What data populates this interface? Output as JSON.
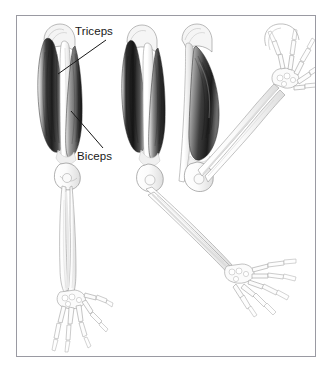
{
  "figure": {
    "border_color": "#9a9aa2",
    "background_color": "#ffffff",
    "ink_color": "#181818",
    "labels": [
      {
        "id": "triceps",
        "text": "Triceps",
        "leader_from": [
          106,
          40
        ],
        "leader_to": [
          58,
          74
        ]
      },
      {
        "id": "biceps",
        "text": "Biceps",
        "leader_from": [
          71,
          111
        ],
        "leader_to": [
          103,
          148
        ]
      }
    ],
    "views": [
      {
        "id": "view-extended-front",
        "description": "Left view: arm fully extended downward, triceps shaded dark on the outer side, biceps on inner side, with forearm bones and open skeletal hand at bottom."
      },
      {
        "id": "view-extended-oblique",
        "description": "Middle-left view: upper arm with muscles, elbow bent slightly, forearm extending diagonally down and to the right ending in a skeletal hand."
      },
      {
        "id": "view-flexed",
        "description": "Right view: upper arm with contracted biceps, elbow strongly flexed, forearm angled upward to the right, skeletal hand raised at top right."
      }
    ],
    "muscles": [
      {
        "name": "Triceps",
        "shading": "dark",
        "side": "posterior"
      },
      {
        "name": "Biceps",
        "shading": "mid",
        "side": "anterior"
      }
    ],
    "skeletal_parts": [
      "humerus",
      "radius",
      "ulna",
      "carpals",
      "metacarpals",
      "phalanges"
    ]
  }
}
